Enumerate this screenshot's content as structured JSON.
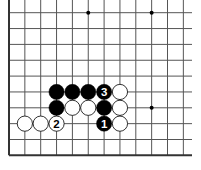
{
  "board": {
    "origin_x": 9,
    "origin_y": 12.7,
    "spacing": 15.85,
    "cols": 12,
    "rows": 10,
    "right_extent": 192,
    "bottom_edge_row": 9,
    "line_color": "#555555",
    "edge_color": "#333333",
    "star_points": [
      [
        5,
        0
      ],
      [
        9,
        0
      ],
      [
        9,
        6
      ]
    ],
    "stones": [
      {
        "c": 3,
        "r": 5,
        "color": "black",
        "label": ""
      },
      {
        "c": 4,
        "r": 5,
        "color": "black",
        "label": ""
      },
      {
        "c": 5,
        "r": 5,
        "color": "black",
        "label": ""
      },
      {
        "c": 6,
        "r": 5,
        "color": "black",
        "label": "3"
      },
      {
        "c": 7,
        "r": 5,
        "color": "white",
        "label": ""
      },
      {
        "c": 3,
        "r": 6,
        "color": "black",
        "label": ""
      },
      {
        "c": 4,
        "r": 6,
        "color": "white",
        "label": ""
      },
      {
        "c": 5,
        "r": 6,
        "color": "white",
        "label": ""
      },
      {
        "c": 6,
        "r": 6,
        "color": "black",
        "label": ""
      },
      {
        "c": 7,
        "r": 6,
        "color": "white",
        "label": ""
      },
      {
        "c": 1,
        "r": 7,
        "color": "white",
        "label": ""
      },
      {
        "c": 2,
        "r": 7,
        "color": "white",
        "label": ""
      },
      {
        "c": 3,
        "r": 7,
        "color": "white",
        "label": "2"
      },
      {
        "c": 6,
        "r": 7,
        "color": "black",
        "label": "1"
      },
      {
        "c": 7,
        "r": 7,
        "color": "white",
        "label": ""
      }
    ]
  }
}
